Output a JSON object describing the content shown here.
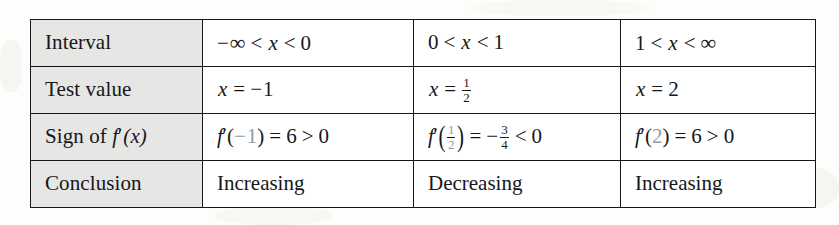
{
  "table": {
    "caption_rows": [
      "Interval",
      "Test value",
      "Sign of f'(x)",
      "Conclusion"
    ],
    "row_labels": {
      "interval": "Interval",
      "test_value": "Test value",
      "sign_prefix": "Sign of ",
      "sign_f": "f",
      "sign_prime": "′",
      "sign_arg": "(x)",
      "conclusion": "Conclusion"
    },
    "columns": [
      {
        "interval": {
          "negative_sign": "−",
          "left_bound": "∞",
          "rel1": "<",
          "variable": "x",
          "rel2": "<",
          "right_bound": "0"
        },
        "test_value": {
          "variable": "x",
          "equals": "=",
          "negative_sign": "−",
          "value": "1"
        },
        "sign": {
          "f": "f",
          "prime": "′",
          "open_paren": "(",
          "arg_sign": "−",
          "arg": "1",
          "close_paren": ")",
          "equals": "=",
          "result": "6",
          "relation": ">",
          "compare_to": "0"
        },
        "conclusion": "Increasing"
      },
      {
        "interval": {
          "left_bound": "0",
          "rel1": "<",
          "variable": "x",
          "rel2": "<",
          "right_bound": "1"
        },
        "test_value": {
          "variable": "x",
          "equals": "=",
          "numerator": "1",
          "denominator": "2"
        },
        "sign": {
          "f": "f",
          "prime": "′",
          "open_paren": "(",
          "arg_numerator": "1",
          "arg_denominator": "2",
          "close_paren": ")",
          "equals": "=",
          "result_sign": "−",
          "result_numerator": "3",
          "result_denominator": "4",
          "relation": "<",
          "compare_to": "0"
        },
        "conclusion": "Decreasing"
      },
      {
        "interval": {
          "left_bound": "1",
          "rel1": "<",
          "variable": "x",
          "rel2": "<",
          "right_bound": "∞"
        },
        "test_value": {
          "variable": "x",
          "equals": "=",
          "value": "2"
        },
        "sign": {
          "f": "f",
          "prime": "′",
          "open_paren": "(",
          "arg": "2",
          "close_paren": ")",
          "equals": "=",
          "result": "6",
          "relation": ">",
          "compare_to": "0"
        },
        "conclusion": "Increasing"
      }
    ]
  },
  "colors": {
    "ink": "#16171a",
    "header_fill": "#e6e6e4",
    "cell_fill": "#ffffff",
    "page": "#fdfdfb",
    "tint": "#8d9aa6"
  }
}
